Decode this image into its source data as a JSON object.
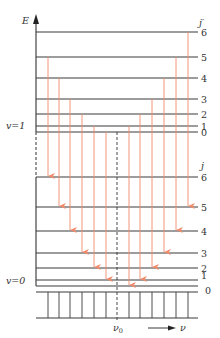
{
  "axis": {
    "energy_label": "E",
    "frequency_label": "ν",
    "center_frequency_label": "ν",
    "center_frequency_sub": "0"
  },
  "upper_state": {
    "vib_label": "v=1",
    "rot_label": "j′",
    "levels": [
      {
        "j": "6",
        "y": 32
      },
      {
        "j": "5",
        "y": 57
      },
      {
        "j": "4",
        "y": 78
      },
      {
        "j": "3",
        "y": 99
      },
      {
        "j": "2",
        "y": 114
      },
      {
        "j": "1",
        "y": 126
      },
      {
        "j": "0",
        "y": 132
      }
    ]
  },
  "lower_state": {
    "vib_label": "v=0",
    "rot_label": "j",
    "levels": [
      {
        "j": "6",
        "y": 177
      },
      {
        "j": "5",
        "y": 207
      },
      {
        "j": "4",
        "y": 231
      },
      {
        "j": "3",
        "y": 253
      },
      {
        "j": "2",
        "y": 268
      },
      {
        "j": "1",
        "y": 280
      },
      {
        "j": "0",
        "y": 286
      }
    ]
  },
  "transitions": [
    {
      "branch": "P",
      "x": 48,
      "from_y": 57,
      "to_y": 177
    },
    {
      "branch": "P",
      "x": 59,
      "from_y": 78,
      "to_y": 207
    },
    {
      "branch": "P",
      "x": 70,
      "from_y": 99,
      "to_y": 231
    },
    {
      "branch": "P",
      "x": 82,
      "from_y": 114,
      "to_y": 253
    },
    {
      "branch": "P",
      "x": 94,
      "from_y": 126,
      "to_y": 268
    },
    {
      "branch": "P",
      "x": 106,
      "from_y": 132,
      "to_y": 280
    },
    {
      "branch": "R",
      "x": 129,
      "from_y": 126,
      "to_y": 286
    },
    {
      "branch": "R",
      "x": 140,
      "from_y": 114,
      "to_y": 280
    },
    {
      "branch": "R",
      "x": 152,
      "from_y": 99,
      "to_y": 268
    },
    {
      "branch": "R",
      "x": 164,
      "from_y": 78,
      "to_y": 253
    },
    {
      "branch": "R",
      "x": 176,
      "from_y": 57,
      "to_y": 231
    },
    {
      "branch": "R",
      "x": 188,
      "from_y": 32,
      "to_y": 207
    }
  ],
  "spectrum_lines_x": [
    48,
    59,
    70,
    82,
    94,
    106,
    129,
    140,
    152,
    164,
    176,
    188
  ],
  "colors": {
    "level": "#3a3a3a",
    "transition": "#f08a6a"
  }
}
